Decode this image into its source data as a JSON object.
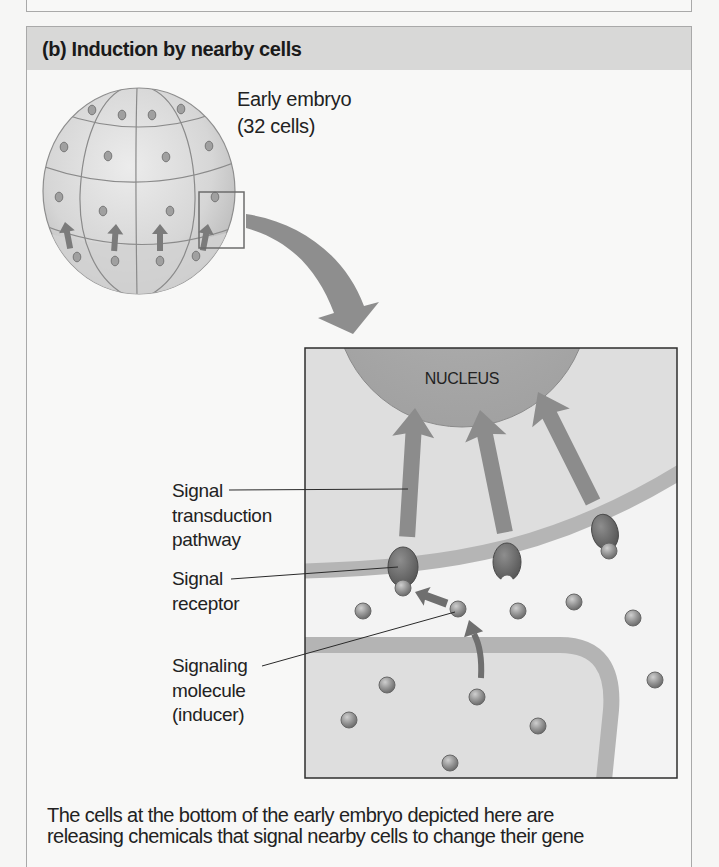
{
  "figure": {
    "panel_label": "(b) Induction by nearby cells",
    "embryo_label": [
      "Early embryo",
      "(32 cells)"
    ],
    "nucleus_label": "NUCLEUS",
    "labels": {
      "transduction": [
        "Signal",
        "transduction",
        "pathway"
      ],
      "receptor": [
        "Signal",
        "receptor"
      ],
      "molecule": [
        "Signaling",
        "molecule",
        "(inducer)"
      ]
    },
    "caption": [
      "The cells at the bottom of the early embryo depicted here are",
      "releasing chemicals that signal nearby cells to change their gene"
    ],
    "icons": {
      "embryo": "embryo-icon",
      "zoom_arrow": "curved-arrow-icon",
      "signal_arrows": "arrow-up-icon",
      "receptor": "receptor-icon",
      "molecule": "molecule-icon"
    }
  },
  "colors": {
    "header_bg": "#d8d8d7",
    "panel_border": "#a9a9a9",
    "nucleus": "#a8a8a8",
    "arrow": "#8c8c8c",
    "membrane": "#b5b5b5",
    "cell_interior": "#dedede",
    "receptor": "#5e5e5e"
  }
}
